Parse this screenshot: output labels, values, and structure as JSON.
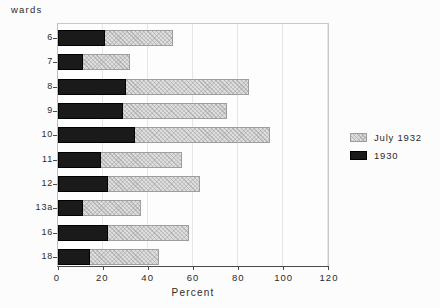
{
  "labels": {
    "y_axis_title": "wards",
    "x_axis_title": "Percent"
  },
  "legend": [
    {
      "label": "July 1932",
      "swatch": "hatched"
    },
    {
      "label": "1930",
      "swatch": "solid"
    }
  ],
  "colors": {
    "bar_1930": "#1a1a1a",
    "bar_july1932_base": "#dedede",
    "bar_july1932_hatch": "#a8a8a8",
    "gridline": "#e6e6e6",
    "axis": "#4a4a4a",
    "text": "#2b2b2b",
    "background": "#fcfcfc"
  },
  "chart_data": {
    "type": "bar",
    "orientation": "horizontal",
    "title": "",
    "xlabel": "Percent",
    "ylabel": "wards",
    "xlim": [
      0,
      120
    ],
    "x_ticks": [
      0,
      20,
      40,
      60,
      80,
      100,
      120
    ],
    "grid": "vertical",
    "legend_position": "right",
    "categories": [
      "6",
      "7",
      "8",
      "9",
      "10",
      "11",
      "12",
      "13a",
      "16",
      "18"
    ],
    "series": [
      {
        "name": "1930",
        "style": "solid-black",
        "values": [
          21,
          11,
          30,
          29,
          34,
          19,
          22,
          11,
          22,
          14
        ]
      },
      {
        "name": "July 1932",
        "style": "hatched-gray",
        "values": [
          51,
          32,
          85,
          75,
          94,
          55,
          63,
          37,
          58,
          45
        ]
      }
    ],
    "note": "July 1932 bars drawn from 0 to value with 1930 bars overlaid on top starting at 0; visible hatched segment runs from the 1930 value to the July 1932 value"
  }
}
